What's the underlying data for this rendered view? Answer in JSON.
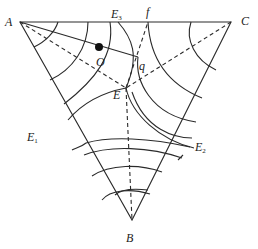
{
  "diagram": {
    "type": "ternary phase diagram",
    "vertices": {
      "A": {
        "label": "A"
      },
      "B": {
        "label": "B"
      },
      "C": {
        "label": "C"
      }
    },
    "points": {
      "E": {
        "label": "E"
      },
      "O": {
        "label": "O"
      },
      "q": {
        "label": "q"
      },
      "f": {
        "label": "f"
      },
      "E1": {
        "label": "E",
        "sub": "1"
      },
      "E2": {
        "label": "E",
        "sub": "2"
      },
      "E3": {
        "label": "E",
        "sub": "3"
      }
    },
    "colors": {
      "line": "#2a2a2a",
      "background": "#ffffff"
    }
  }
}
